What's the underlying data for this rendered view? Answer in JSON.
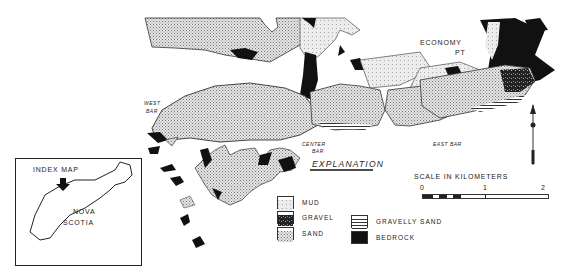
{
  "map": {
    "labels": {
      "economy": "ECONOMY",
      "pt": "PT",
      "west": "WEST",
      "west_bar": "BAR",
      "center": "CENTER",
      "center_bar": "BAR",
      "east_bar": "EAST   BAR",
      "explanation": "EXPLANATION"
    },
    "inset": {
      "title": "INDEX   MAP",
      "nova": "NOVA",
      "scotia": "SCOTIA"
    },
    "legend": [
      {
        "label": "MUD",
        "pattern": "mud"
      },
      {
        "label": "GRAVEL",
        "pattern": "gravel"
      },
      {
        "label": "SAND",
        "pattern": "sand"
      },
      {
        "label": "GRAVELLY   SAND",
        "pattern": "gravelly-sand"
      },
      {
        "label": "BEDROCK",
        "pattern": "bedrock"
      }
    ],
    "scale": {
      "title": "SCALE   IN   KILOMETERS",
      "ticks": [
        "0",
        "1",
        "2"
      ]
    },
    "colors": {
      "bedrock": "#111111",
      "sand": "#c8c8c8",
      "mud": "#dcdcdc",
      "outline": "#333333"
    }
  }
}
